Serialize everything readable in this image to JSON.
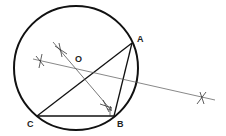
{
  "diagram": {
    "type": "geometric-construction",
    "colors": {
      "stroke": "#111111",
      "thin_stroke": "#555555",
      "label": "#222222",
      "background": "#ffffff"
    },
    "circle": {
      "cx": 76,
      "cy": 68,
      "r": 62
    },
    "points": {
      "A": {
        "label": "A",
        "x": 132,
        "y": 43,
        "label_x": 137,
        "label_y": 42
      },
      "B": {
        "label": "B",
        "x": 114,
        "y": 116,
        "label_x": 117,
        "label_y": 126
      },
      "C": {
        "label": "C",
        "x": 37,
        "y": 116,
        "label_x": 27,
        "label_y": 126
      },
      "O": {
        "label": "O",
        "x": 78,
        "y": 63,
        "label_x": 75,
        "label_y": 62
      }
    },
    "bisector_lines": [
      {
        "name": "bisector-of-ac",
        "x1": 33,
        "y1": 59,
        "x2": 215,
        "y2": 100
      },
      {
        "name": "bisector-of-cb",
        "x1": 53,
        "y1": 42,
        "x2": 111,
        "y2": 110
      }
    ],
    "arc_marks": [
      {
        "name": "arc-mark-left",
        "x": 40,
        "y": 61
      },
      {
        "name": "arc-mark-upper",
        "x": 61,
        "y": 50
      },
      {
        "name": "arc-mark-right",
        "x": 202,
        "y": 98
      },
      {
        "name": "arc-mark-near-b",
        "x": 106,
        "y": 106
      }
    ]
  }
}
